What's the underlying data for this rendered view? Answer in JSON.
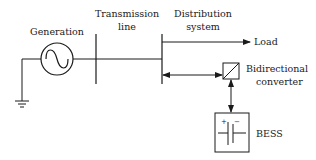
{
  "diagram": {
    "type": "power-system-block-diagram",
    "labels": {
      "generation": "Generation",
      "transmission_line_1": "Transmission",
      "transmission_line_2": "line",
      "distribution_1": "Distribution",
      "distribution_2": "system",
      "load": "Load",
      "converter_1": "Bidirectional",
      "converter_2": "converter",
      "bess": "BESS",
      "battery_plus": "+",
      "battery_minus": "−"
    },
    "nodes": [
      {
        "id": "generation",
        "label": "Generation",
        "shape": "ac-source-circle"
      },
      {
        "id": "transmission",
        "label": "Transmission line",
        "shape": "bus-bar"
      },
      {
        "id": "distribution",
        "label": "Distribution system",
        "shape": "bus-bar"
      },
      {
        "id": "load",
        "label": "Load",
        "shape": "arrow-terminal"
      },
      {
        "id": "converter",
        "label": "Bidirectional converter",
        "shape": "converter-box"
      },
      {
        "id": "bess",
        "label": "BESS",
        "shape": "battery-box"
      },
      {
        "id": "ground",
        "label": "",
        "shape": "ground-symbol"
      }
    ],
    "edges": [
      {
        "from": "ground",
        "to": "generation",
        "direction": "none"
      },
      {
        "from": "generation",
        "to": "transmission",
        "direction": "none"
      },
      {
        "from": "transmission",
        "to": "distribution",
        "direction": "none"
      },
      {
        "from": "distribution",
        "to": "load",
        "direction": "forward"
      },
      {
        "from": "distribution",
        "to": "converter",
        "direction": "bidirectional"
      },
      {
        "from": "converter",
        "to": "bess",
        "direction": "bidirectional"
      }
    ],
    "colors": {
      "stroke": "#1a1a1a",
      "background": "#ffffff"
    }
  }
}
